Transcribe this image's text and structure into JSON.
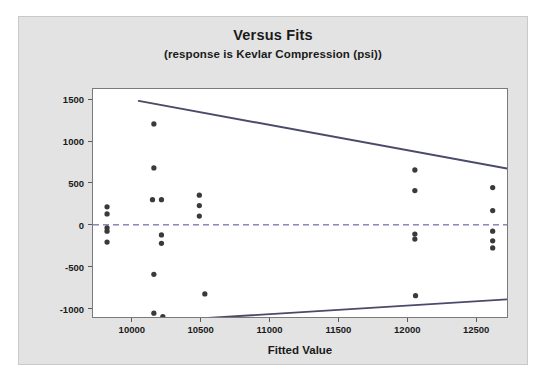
{
  "chart_data": {
    "type": "scatter",
    "title": "Versus Fits",
    "subtitle": "(response is Kevlar Compression (psi))",
    "xlabel": "Fitted Value",
    "ylabel": "Residual",
    "xlim": [
      9718,
      12724
    ],
    "ylim": [
      -1100,
      1622
    ],
    "xticks": [
      10000,
      10500,
      11000,
      11500,
      12000,
      12500
    ],
    "yticks": [
      1500,
      1000,
      500,
      0,
      -500,
      -1000
    ],
    "grid": false,
    "legend": null,
    "zero_reference_line": {
      "value": 0,
      "style": "dashed",
      "color": "#4a4a9a"
    },
    "marker": {
      "shape": "circle",
      "color": "#3a3a3a",
      "size": 5
    },
    "points": [
      {
        "x": 9820,
        "y": 215
      },
      {
        "x": 9820,
        "y": 130
      },
      {
        "x": 9820,
        "y": -35
      },
      {
        "x": 9820,
        "y": -75
      },
      {
        "x": 9820,
        "y": -205
      },
      {
        "x": 10160,
        "y": 1205
      },
      {
        "x": 10160,
        "y": 680
      },
      {
        "x": 10150,
        "y": 300
      },
      {
        "x": 10215,
        "y": 300
      },
      {
        "x": 10215,
        "y": -120
      },
      {
        "x": 10215,
        "y": -220
      },
      {
        "x": 10160,
        "y": -590
      },
      {
        "x": 10160,
        "y": -1055
      },
      {
        "x": 10225,
        "y": -1095
      },
      {
        "x": 10490,
        "y": 355
      },
      {
        "x": 10490,
        "y": 230
      },
      {
        "x": 10490,
        "y": 105
      },
      {
        "x": 10530,
        "y": -825
      },
      {
        "x": 12055,
        "y": 655
      },
      {
        "x": 12055,
        "y": 410
      },
      {
        "x": 12055,
        "y": -110
      },
      {
        "x": 12055,
        "y": -170
      },
      {
        "x": 12060,
        "y": -845
      },
      {
        "x": 12620,
        "y": 445
      },
      {
        "x": 12620,
        "y": 170
      },
      {
        "x": 12620,
        "y": -75
      },
      {
        "x": 12620,
        "y": -190
      },
      {
        "x": 12620,
        "y": -275
      }
    ],
    "reference_lines": [
      {
        "name": "upper-bound-line",
        "color": "#4a4a6a",
        "style": "solid",
        "points": [
          {
            "x": 10050,
            "y": 1480
          },
          {
            "x": 12724,
            "y": 672
          }
        ]
      },
      {
        "name": "lower-bound-line",
        "color": "#4a4a6a",
        "style": "solid",
        "points": [
          {
            "x": 10125,
            "y": -1155
          },
          {
            "x": 12724,
            "y": -890
          }
        ]
      }
    ]
  }
}
